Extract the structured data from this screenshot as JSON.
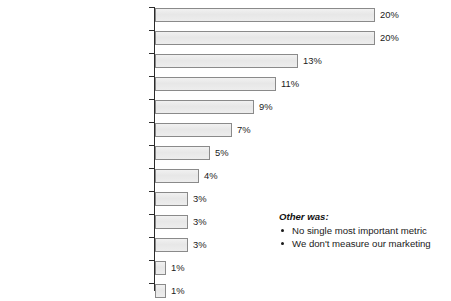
{
  "chart_data": {
    "type": "bar",
    "orientation": "horizontal",
    "title": "",
    "subtitle": "",
    "xlabel": "",
    "ylabel": "",
    "xlim": [
      0,
      20
    ],
    "grid": false,
    "legend": null,
    "value_suffix": "%",
    "categories": [
      "Conversion to Revenue",
      "Social Media Engagement",
      "Conversion to Qualified Lead,\nDemo, Trial or Sign-up",
      "Qualified Leads",
      "Unique Visitors (New Users)\nto Website/Blog",
      "Campaign-Specific Metrics",
      "New Leads (top of funnel)",
      "Social Media Audience",
      "Brand Equity, Recall",
      "Total Impressions/Reach",
      "Social Media Activity",
      "Cost per Click (CPC)",
      "Other"
    ],
    "values": [
      20,
      20,
      13,
      11,
      9,
      7,
      5,
      4,
      3,
      3,
      3,
      1,
      1
    ],
    "value_labels": [
      "20%",
      "20%",
      "13%",
      "11%",
      "9%",
      "7%",
      "5%",
      "4%",
      "3%",
      "3%",
      "3%",
      "1%",
      "1%"
    ],
    "bar_fill_color": "#e9e9e9",
    "bar_border_color": "#8a8a8a",
    "axis_color": "#2b2b2b",
    "text_color": "#1a1a1a"
  },
  "annotation": {
    "title": "Other was:",
    "items": [
      "No single most important metric",
      "We don't measure our marketing"
    ]
  }
}
